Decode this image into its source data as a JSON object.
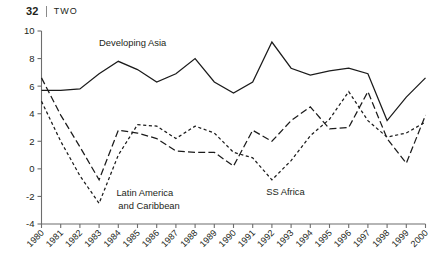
{
  "header": {
    "folio": "32",
    "chapter": "TWO"
  },
  "chart_data": {
    "type": "line",
    "title": "",
    "xlabel": "",
    "ylabel": "",
    "xlim": [
      1980,
      2000
    ],
    "ylim": [
      -4,
      10
    ],
    "yticks": [
      -4,
      -2,
      0,
      2,
      4,
      6,
      8,
      10
    ],
    "ytick_labels": [
      "-4",
      "-2",
      "0",
      "2",
      "4",
      "6",
      "8",
      "10"
    ],
    "grid": false,
    "legend": "inline-annotations",
    "x": [
      1980,
      1981,
      1982,
      1983,
      1984,
      1985,
      1986,
      1987,
      1988,
      1989,
      1990,
      1991,
      1992,
      1993,
      1994,
      1995,
      1996,
      1997,
      1998,
      1999,
      2000
    ],
    "xtick_labels": [
      "1980",
      "1981",
      "1982",
      "1983",
      "1984",
      "1985",
      "1986",
      "1987",
      "1988",
      "1989",
      "1990",
      "1991",
      "1992",
      "1993",
      "1994",
      "1995",
      "1996",
      "1997",
      "1998",
      "1999",
      "2000"
    ],
    "series": [
      {
        "name": "Developing Asia",
        "style": "solid",
        "color": "#1b1b1b",
        "label_position": "upper-left",
        "values": [
          5.7,
          5.7,
          5.8,
          6.9,
          7.8,
          7.2,
          6.3,
          6.9,
          8.0,
          6.3,
          5.5,
          6.3,
          9.2,
          7.3,
          6.8,
          7.1,
          7.3,
          6.9,
          3.5,
          5.2,
          6.6
        ]
      },
      {
        "name": "Latin America and Caribbean",
        "style": "dash-dot",
        "color": "#1b1b1b",
        "label_position": "lower-left",
        "values": [
          6.6,
          3.9,
          1.6,
          -0.8,
          2.8,
          2.6,
          2.2,
          1.3,
          1.2,
          1.2,
          0.2,
          2.8,
          2.0,
          3.5,
          4.5,
          2.9,
          3.0,
          5.6,
          2.2,
          0.4,
          3.9
        ]
      },
      {
        "name": "SS Africa",
        "style": "dotted",
        "color": "#1b1b1b",
        "label_position": "lower-right",
        "values": [
          4.9,
          2.0,
          -0.5,
          -2.5,
          1.0,
          3.2,
          3.1,
          2.2,
          3.1,
          2.6,
          1.2,
          0.8,
          -0.8,
          0.6,
          2.4,
          3.6,
          5.6,
          3.5,
          2.3,
          2.6,
          3.4
        ]
      }
    ],
    "annotations": [
      {
        "text": "Developing Asia",
        "x": 1983.0,
        "y": 8.9
      },
      {
        "text": "Latin America",
        "x": 1983.9,
        "y": -2.0
      },
      {
        "text": "and Caribbean",
        "x": 1984.0,
        "y": -2.9
      },
      {
        "text": "SS Africa",
        "x": 1991.7,
        "y": -1.9
      }
    ]
  }
}
